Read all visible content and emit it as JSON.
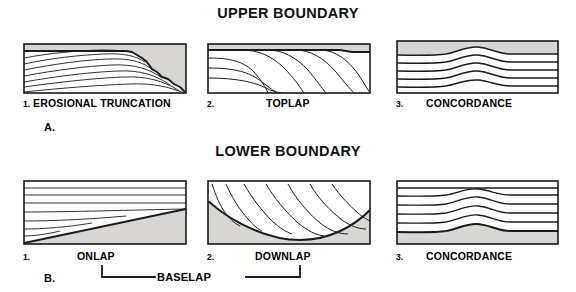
{
  "figure": {
    "sections": [
      {
        "id": "upper",
        "heading": "UPPER BOUNDARY",
        "group_label": "A.",
        "panels": [
          {
            "number": "1.",
            "label": "EROSIONAL TRUNCATION",
            "pattern": "erosional-truncation"
          },
          {
            "number": "2.",
            "label": "TOPLAP",
            "pattern": "toplap"
          },
          {
            "number": "3.",
            "label": "CONCORDANCE",
            "pattern": "concordance-upper"
          }
        ]
      },
      {
        "id": "lower",
        "heading": "LOWER BOUNDARY",
        "group_label": "B.",
        "panels": [
          {
            "number": "1.",
            "label": "ONLAP",
            "pattern": "onlap"
          },
          {
            "number": "2.",
            "label": "DOWNLAP",
            "pattern": "downlap"
          },
          {
            "number": "3.",
            "label": "CONCORDANCE",
            "pattern": "concordance-lower"
          }
        ]
      }
    ],
    "bracket": {
      "label": "BASELAP",
      "spans": [
        "ONLAP",
        "DOWNLAP"
      ]
    },
    "colors": {
      "line": "#1a1a1a",
      "fill": "#ffffff",
      "shading": "#d8d6d2",
      "background": "#ffffff",
      "text": "#000000"
    }
  }
}
